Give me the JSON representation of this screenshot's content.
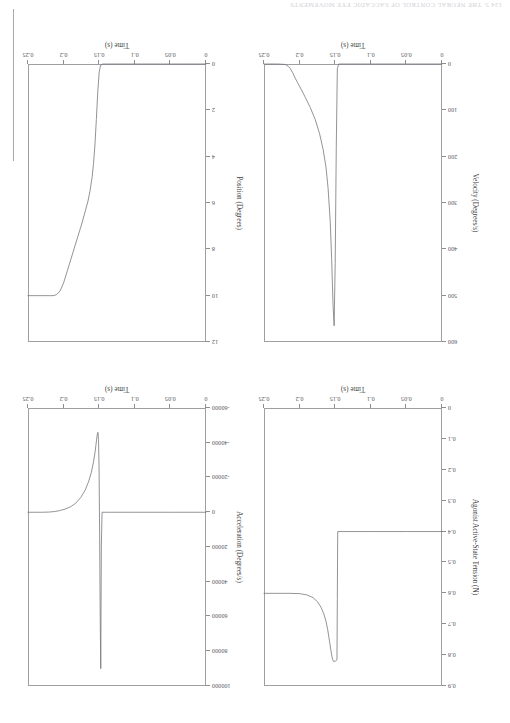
{
  "page": {
    "header_text": "124    5. THE NEURAL CONTROL OF SACCADIC EYE MOVEMENTS"
  },
  "chart_data": [
    {
      "id": "position",
      "type": "line",
      "title": "",
      "xlabel": "Time (s)",
      "ylabel": "Position (Degrees)",
      "xlim": [
        0,
        0.25
      ],
      "ylim": [
        0,
        12
      ],
      "xticks": [
        "0",
        "0.05",
        "0.1",
        "0.15",
        "0.2",
        "0.25"
      ],
      "xtick_values": [
        0,
        0.05,
        0.1,
        0.15,
        0.2,
        0.25
      ],
      "yticks": [
        "0",
        "2",
        "4",
        "6",
        "8",
        "10",
        "12"
      ],
      "ytick_values": [
        0,
        2,
        4,
        6,
        8,
        10,
        12
      ],
      "grid": false,
      "legend": "none",
      "series": [
        {
          "name": "Position",
          "x": [
            0,
            0.02,
            0.04,
            0.06,
            0.08,
            0.1,
            0.12,
            0.14,
            0.145,
            0.148,
            0.15,
            0.152,
            0.154,
            0.156,
            0.158,
            0.16,
            0.163,
            0.166,
            0.17,
            0.175,
            0.18,
            0.185,
            0.19,
            0.195,
            0.2,
            0.205,
            0.21,
            0.215,
            0.22,
            0.23,
            0.24,
            0.25
          ],
          "y": [
            0,
            0,
            0,
            0,
            0,
            0,
            0,
            0,
            0,
            0.05,
            0.35,
            1.2,
            2.4,
            3.5,
            4.3,
            4.9,
            5.5,
            5.95,
            6.4,
            6.95,
            7.45,
            7.95,
            8.45,
            8.95,
            9.45,
            9.8,
            9.96,
            10.0,
            10.0,
            10.0,
            10.0,
            10.0
          ]
        }
      ]
    },
    {
      "id": "velocity",
      "type": "line",
      "title": "",
      "xlabel": "Time (s)",
      "ylabel": "Velocity (Degrees/s)",
      "xlim": [
        0,
        0.25
      ],
      "ylim": [
        0,
        600
      ],
      "xticks": [
        "0",
        "0.05",
        "0.1",
        "0.15",
        "0.2",
        "0.25"
      ],
      "xtick_values": [
        0,
        0.05,
        0.1,
        0.15,
        0.2,
        0.25
      ],
      "yticks": [
        "0",
        "100",
        "200",
        "300",
        "400",
        "500",
        "600"
      ],
      "ytick_values": [
        0,
        100,
        200,
        300,
        400,
        500,
        600
      ],
      "grid": false,
      "legend": "none",
      "series": [
        {
          "name": "Velocity",
          "x": [
            0,
            0.05,
            0.1,
            0.13,
            0.145,
            0.147,
            0.1485,
            0.15,
            0.1515,
            0.153,
            0.155,
            0.157,
            0.16,
            0.163,
            0.167,
            0.172,
            0.178,
            0.185,
            0.192,
            0.198,
            0.203,
            0.207,
            0.21,
            0.213,
            0.216,
            0.22,
            0.23,
            0.25
          ],
          "y": [
            0,
            0,
            0,
            0,
            0,
            10,
            180,
            430,
            565,
            520,
            420,
            340,
            268,
            222,
            184,
            150,
            120,
            94,
            72,
            54,
            40,
            28,
            18,
            10,
            5,
            1,
            0,
            0
          ]
        }
      ]
    },
    {
      "id": "acceleration",
      "type": "line",
      "title": "",
      "xlabel": "Time (s)",
      "ylabel": "Acceleration (Degrees/s)",
      "xlim": [
        0,
        0.25
      ],
      "ylim": [
        -60000,
        100000
      ],
      "xticks": [
        "0",
        "0.05",
        "0.1",
        "0.15",
        "0.2",
        "0.25"
      ],
      "xtick_values": [
        0,
        0.05,
        0.1,
        0.15,
        0.2,
        0.25
      ],
      "yticks": [
        "-60000",
        "-40000",
        "-20000",
        "0",
        "20000",
        "40000",
        "60000",
        "80000",
        "100000"
      ],
      "ytick_values": [
        -60000,
        -40000,
        -20000,
        0,
        20000,
        40000,
        60000,
        80000,
        100000
      ],
      "grid": false,
      "legend": "none",
      "series": [
        {
          "name": "Acceleration",
          "x": [
            0,
            0.05,
            0.1,
            0.14,
            0.146,
            0.147,
            0.1478,
            0.1486,
            0.1494,
            0.1502,
            0.151,
            0.1518,
            0.153,
            0.1545,
            0.156,
            0.158,
            0.161,
            0.165,
            0.17,
            0.176,
            0.183,
            0.19,
            0.198,
            0.206,
            0.213,
            0.22,
            0.23,
            0.25
          ],
          "y": [
            0,
            0,
            0,
            0,
            0,
            20000,
            90000,
            60000,
            12000,
            -26000,
            -42000,
            -46000,
            -44000,
            -39000,
            -34000,
            -29000,
            -23000,
            -17500,
            -12500,
            -8500,
            -5200,
            -3200,
            -1800,
            -900,
            -400,
            -120,
            0,
            0
          ]
        }
      ]
    },
    {
      "id": "agonist-tension",
      "type": "line",
      "title": "",
      "xlabel": "Time (s)",
      "ylabel": "Agonist Active-State Tension (N)",
      "xlim": [
        0,
        0.25
      ],
      "ylim": [
        0,
        0.9
      ],
      "xticks": [
        "0",
        "0.05",
        "0.1",
        "0.15",
        "0.2",
        "0.25"
      ],
      "xtick_values": [
        0,
        0.05,
        0.1,
        0.15,
        0.2,
        0.25
      ],
      "yticks": [
        "0",
        "0.1",
        "0.2",
        "0.3",
        "0.4",
        "0.5",
        "0.6",
        "0.7",
        "0.8",
        "0.9"
      ],
      "ytick_values": [
        0,
        0.1,
        0.2,
        0.3,
        0.4,
        0.5,
        0.6,
        0.7,
        0.8,
        0.9
      ],
      "grid": false,
      "legend": "none",
      "series": [
        {
          "name": "Agonist Active-State Tension",
          "x": [
            0,
            0.05,
            0.1,
            0.14,
            0.1465,
            0.147,
            0.1475,
            0.15,
            0.1525,
            0.1535,
            0.1545,
            0.156,
            0.158,
            0.1605,
            0.163,
            0.166,
            0.17,
            0.175,
            0.181,
            0.19,
            0.2,
            0.215,
            0.23,
            0.25
          ],
          "y": [
            0.4,
            0.4,
            0.4,
            0.4,
            0.4,
            0.62,
            0.815,
            0.82,
            0.82,
            0.815,
            0.805,
            0.785,
            0.755,
            0.718,
            0.69,
            0.666,
            0.645,
            0.627,
            0.614,
            0.605,
            0.601,
            0.6,
            0.6,
            0.6
          ]
        }
      ]
    }
  ]
}
